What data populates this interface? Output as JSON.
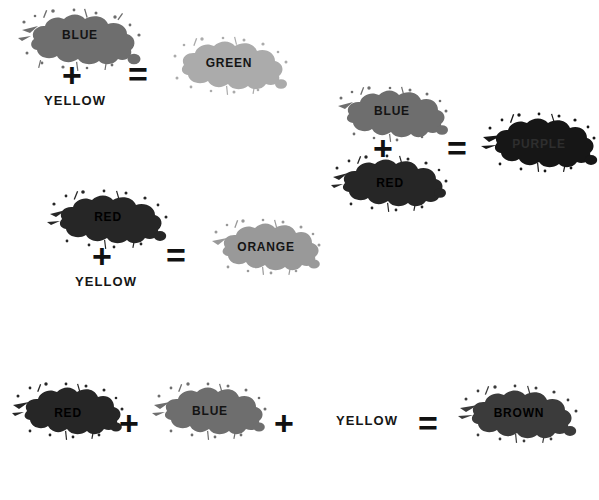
{
  "page": {
    "background": "#ffffff",
    "width": 599,
    "height": 500
  },
  "palette": {
    "blue_blob": "#6e6e6e",
    "red_blob": "#262626",
    "green_blob": "#ababab",
    "orange_blob": "#999999",
    "purple_blob": "#161616",
    "brown_blob": "#3b3b3b",
    "text_dark": "#141414",
    "text_on_dark": "#000000",
    "purple_text": "#2e2e2e",
    "operator": "#111111"
  },
  "operators": {
    "plus": "+",
    "equals": "="
  },
  "equations": [
    {
      "id": "blue-yellow-green",
      "name": "blue-plus-yellow-equals-green",
      "operands": [
        {
          "type": "blob",
          "label": "BLUE",
          "color": "#6e6e6e",
          "text_color": "#141414"
        },
        {
          "type": "word",
          "label": "YELLOW"
        }
      ],
      "result": {
        "type": "blob",
        "label": "GREEN",
        "color": "#ababab",
        "text_color": "#141414"
      }
    },
    {
      "id": "blue-red-purple",
      "name": "blue-plus-red-equals-purple",
      "operands": [
        {
          "type": "blob",
          "label": "BLUE",
          "color": "#6e6e6e",
          "text_color": "#141414"
        },
        {
          "type": "blob",
          "label": "RED",
          "color": "#262626",
          "text_color": "#000000"
        }
      ],
      "result": {
        "type": "blob",
        "label": "PURPLE",
        "color": "#161616",
        "text_color": "#2e2e2e"
      }
    },
    {
      "id": "red-yellow-orange",
      "name": "red-plus-yellow-equals-orange",
      "operands": [
        {
          "type": "blob",
          "label": "RED",
          "color": "#262626",
          "text_color": "#000000"
        },
        {
          "type": "word",
          "label": "YELLOW"
        }
      ],
      "result": {
        "type": "blob",
        "label": "ORANGE",
        "color": "#999999",
        "text_color": "#141414"
      }
    },
    {
      "id": "red-blue-yellow-brown",
      "name": "red-plus-blue-plus-yellow-equals-brown",
      "operands": [
        {
          "type": "blob",
          "label": "RED",
          "color": "#262626",
          "text_color": "#000000"
        },
        {
          "type": "blob",
          "label": "BLUE",
          "color": "#6e6e6e",
          "text_color": "#141414"
        },
        {
          "type": "word",
          "label": "YELLOW"
        }
      ],
      "result": {
        "type": "blob",
        "label": "BROWN",
        "color": "#3b3b3b",
        "text_color": "#000000"
      }
    }
  ]
}
